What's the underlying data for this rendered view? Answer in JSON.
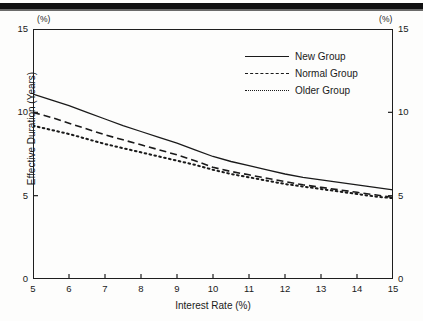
{
  "figure": {
    "left_unit_label": "(%)",
    "right_unit_label": "(%)"
  },
  "legend": {
    "position": "top-right-inside",
    "items": [
      {
        "label": "New Group",
        "style": "solid"
      },
      {
        "label": "Normal Group",
        "style": "dashed"
      },
      {
        "label": "Older Group",
        "style": "dotted"
      }
    ]
  },
  "axes": {
    "x": {
      "label": "Interest Rate (%)",
      "ticks": [
        "5",
        "6",
        "7",
        "8",
        "9",
        "10",
        "11",
        "12",
        "13",
        "14",
        "15"
      ]
    },
    "y_left": {
      "label": "Effective Duration (Years)",
      "ticks": [
        "15",
        "10",
        "5",
        "0"
      ]
    },
    "y_right": {
      "ticks": [
        "15",
        "10",
        "5",
        "0"
      ]
    }
  },
  "chart_data": {
    "type": "line",
    "title": "",
    "xlabel": "Interest Rate (%)",
    "ylabel": "Effective Duration (Years)",
    "xlim": [
      5,
      15
    ],
    "ylim": [
      0,
      15
    ],
    "xticks": [
      5,
      6,
      7,
      8,
      9,
      10,
      11,
      12,
      13,
      14,
      15
    ],
    "yticks": [
      0,
      5,
      10,
      15
    ],
    "grid": false,
    "legend_position": "upper right",
    "x": [
      5,
      5.5,
      6,
      6.5,
      7,
      7.5,
      8,
      8.5,
      9,
      9.5,
      10,
      10.5,
      11,
      11.5,
      12,
      12.5,
      13,
      13.5,
      14,
      14.5,
      15
    ],
    "series": [
      {
        "name": "New Group",
        "style": "solid",
        "values": [
          11.1,
          10.75,
          10.4,
          10.0,
          9.6,
          9.2,
          8.85,
          8.5,
          8.15,
          7.75,
          7.35,
          7.05,
          6.8,
          6.55,
          6.3,
          6.1,
          5.95,
          5.8,
          5.65,
          5.5,
          5.35
        ]
      },
      {
        "name": "Normal Group",
        "style": "dashed",
        "values": [
          10.0,
          9.7,
          9.35,
          9.0,
          8.65,
          8.35,
          8.05,
          7.75,
          7.45,
          7.1,
          6.7,
          6.45,
          6.25,
          6.05,
          5.85,
          5.65,
          5.5,
          5.35,
          5.2,
          5.05,
          4.9
        ]
      },
      {
        "name": "Older Group",
        "style": "dotted",
        "values": [
          9.2,
          8.95,
          8.7,
          8.4,
          8.1,
          7.85,
          7.6,
          7.35,
          7.1,
          6.85,
          6.55,
          6.3,
          6.1,
          5.9,
          5.7,
          5.55,
          5.4,
          5.25,
          5.1,
          4.95,
          4.85
        ]
      }
    ]
  }
}
